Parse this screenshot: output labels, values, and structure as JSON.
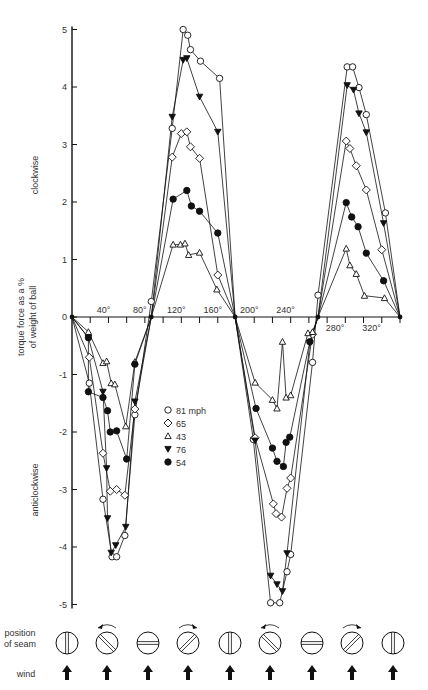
{
  "header": {
    "title": "THE BOWLER'S ART"
  },
  "chart_data": {
    "type": "line",
    "title": "",
    "xlabel": "",
    "ylabel": "torque force as a % of weight of ball",
    "ylabel_lines": [
      "torque force as a %",
      "of weight of ball"
    ],
    "y_region_labels": {
      "positive": "clockwise",
      "negative": "anticlockwise"
    },
    "xlim": [
      0,
      360
    ],
    "ylim": [
      -5,
      5
    ],
    "grid": false,
    "x_ticks": [
      0,
      20,
      40,
      60,
      80,
      100,
      120,
      140,
      160,
      180,
      200,
      220,
      240,
      260,
      280,
      300,
      320,
      340,
      360
    ],
    "x_tick_labels": [
      {
        "value": 40,
        "label": "40°",
        "side": "above"
      },
      {
        "value": 80,
        "label": "80°",
        "side": "above"
      },
      {
        "value": 120,
        "label": "120°",
        "side": "above"
      },
      {
        "value": 160,
        "label": "160°",
        "side": "above"
      },
      {
        "value": 200,
        "label": "200°",
        "side": "above"
      },
      {
        "value": 240,
        "label": "240°",
        "side": "above"
      },
      {
        "value": 280,
        "label": "280°",
        "side": "below"
      },
      {
        "value": 320,
        "label": "320°",
        "side": "below"
      }
    ],
    "y_ticks": [
      5,
      4,
      3,
      2,
      1,
      0,
      -1,
      -2,
      -3,
      -4,
      -5
    ],
    "y_tick_labels": [
      "5",
      "4",
      "3",
      "2",
      "1",
      "0",
      "-1",
      "-2",
      "-3",
      "-4",
      "-5"
    ],
    "legend_placement": "center",
    "series": [
      {
        "name": "81 mph",
        "marker": "open-circle",
        "points": [
          [
            0,
            0
          ],
          [
            19,
            -1.15
          ],
          [
            34,
            -3.17
          ],
          [
            44,
            -4.17
          ],
          [
            49,
            -4.17
          ],
          [
            58,
            -3.8
          ],
          [
            69,
            -1.7
          ],
          [
            87,
            0.27
          ],
          [
            110,
            3.28
          ],
          [
            122,
            5.0
          ],
          [
            127,
            4.9
          ],
          [
            130,
            4.65
          ],
          [
            141,
            4.45
          ],
          [
            162,
            4.15
          ],
          [
            179,
            0
          ],
          [
            199,
            -2.13
          ],
          [
            218,
            -4.97
          ],
          [
            228,
            -4.97
          ],
          [
            236,
            -4.43
          ],
          [
            240,
            -4.13
          ],
          [
            264,
            -0.79
          ],
          [
            270,
            0.38
          ],
          [
            302,
            4.35
          ],
          [
            308,
            4.35
          ],
          [
            315,
            3.99
          ],
          [
            323,
            3.52
          ],
          [
            344,
            1.81
          ],
          [
            360,
            0
          ]
        ]
      },
      {
        "name": "65",
        "marker": "open-diamond",
        "points": [
          [
            0,
            0
          ],
          [
            19,
            -0.7
          ],
          [
            34,
            -2.37
          ],
          [
            42,
            -3.03
          ],
          [
            49,
            -3.0
          ],
          [
            58,
            -3.1
          ],
          [
            69,
            -1.6
          ],
          [
            87,
            0
          ],
          [
            110,
            2.78
          ],
          [
            120,
            3.19
          ],
          [
            126,
            3.22
          ],
          [
            130,
            2.96
          ],
          [
            140,
            2.76
          ],
          [
            160,
            0.73
          ],
          [
            179,
            0
          ],
          [
            201,
            -2.1
          ],
          [
            221,
            -3.25
          ],
          [
            224,
            -3.42
          ],
          [
            230,
            -3.48
          ],
          [
            236,
            -2.98
          ],
          [
            240,
            -2.8
          ],
          [
            264,
            -0.3
          ],
          [
            270,
            0
          ],
          [
            301,
            3.06
          ],
          [
            305,
            2.93
          ],
          [
            312,
            2.63
          ],
          [
            323,
            2.21
          ],
          [
            340,
            1.17
          ],
          [
            360,
            0
          ]
        ]
      },
      {
        "name": "43",
        "marker": "open-triangle",
        "points": [
          [
            0,
            0
          ],
          [
            18,
            -0.26
          ],
          [
            34,
            -0.8
          ],
          [
            38,
            -0.77
          ],
          [
            43,
            -1.15
          ],
          [
            47,
            -1.17
          ],
          [
            59,
            -1.9
          ],
          [
            69,
            -0.78
          ],
          [
            87,
            0
          ],
          [
            111,
            1.26
          ],
          [
            119,
            1.26
          ],
          [
            124,
            1.28
          ],
          [
            128,
            1.08
          ],
          [
            140,
            1.12
          ],
          [
            159,
            0.48
          ],
          [
            179,
            0
          ],
          [
            201,
            -1.14
          ],
          [
            220,
            -1.44
          ],
          [
            225,
            -1.59
          ],
          [
            231,
            -0.43
          ],
          [
            235,
            -1.4
          ],
          [
            240,
            -1.36
          ],
          [
            259,
            -0.28
          ],
          [
            264,
            -0.26
          ],
          [
            270,
            0
          ],
          [
            301,
            1.19
          ],
          [
            305,
            0.9
          ],
          [
            312,
            0.75
          ],
          [
            321,
            0.37
          ],
          [
            343,
            0.33
          ],
          [
            360,
            0
          ]
        ]
      },
      {
        "name": "76",
        "marker": "filled-triangle-down",
        "points": [
          [
            0,
            0
          ],
          [
            18,
            -0.36
          ],
          [
            34,
            -1.3
          ],
          [
            38,
            -2.63
          ],
          [
            39,
            -3.5
          ],
          [
            43,
            -4.1
          ],
          [
            48,
            -3.97
          ],
          [
            59,
            -3.65
          ],
          [
            69,
            -1.47
          ],
          [
            87,
            0
          ],
          [
            110,
            3.48
          ],
          [
            122,
            4.47
          ],
          [
            126,
            4.5
          ],
          [
            140,
            3.83
          ],
          [
            160,
            3.22
          ],
          [
            179,
            0
          ],
          [
            201,
            -2.15
          ],
          [
            218,
            -4.5
          ],
          [
            225,
            -4.65
          ],
          [
            231,
            -4.77
          ],
          [
            236,
            -4.11
          ],
          [
            261,
            -0.45
          ],
          [
            270,
            0
          ],
          [
            302,
            4.03
          ],
          [
            309,
            3.95
          ],
          [
            315,
            3.54
          ],
          [
            323,
            3.21
          ],
          [
            342,
            1.63
          ],
          [
            360,
            0
          ]
        ]
      },
      {
        "name": "54",
        "marker": "filled-circle",
        "points": [
          [
            0,
            0
          ],
          [
            18,
            -0.36
          ],
          [
            18,
            -1.3
          ],
          [
            34,
            -1.4
          ],
          [
            39,
            -1.63
          ],
          [
            42,
            -2.0
          ],
          [
            49,
            -1.98
          ],
          [
            60,
            -2.47
          ],
          [
            69,
            -0.82
          ],
          [
            87,
            0
          ],
          [
            111,
            2.05
          ],
          [
            126,
            2.2
          ],
          [
            131,
            1.93
          ],
          [
            140,
            1.84
          ],
          [
            160,
            1.46
          ],
          [
            179,
            0
          ],
          [
            202,
            -1.59
          ],
          [
            220,
            -2.28
          ],
          [
            225,
            -2.51
          ],
          [
            232,
            -2.6
          ],
          [
            235,
            -2.18
          ],
          [
            239,
            -2.09
          ],
          [
            261,
            -0.43
          ],
          [
            270,
            0
          ],
          [
            301,
            1.99
          ],
          [
            307,
            1.74
          ],
          [
            314,
            1.57
          ],
          [
            323,
            1.11
          ],
          [
            342,
            0.63
          ],
          [
            360,
            0
          ]
        ]
      }
    ]
  },
  "strip": {
    "row_labels": {
      "position_line1": "position",
      "position_line2": "of seam",
      "wind": "wind"
    },
    "balls": [
      {
        "seam": "vertical",
        "rotation": "none"
      },
      {
        "seam": "backslash",
        "rotation": "anticlockwise"
      },
      {
        "seam": "horizontal",
        "rotation": "none"
      },
      {
        "seam": "slash",
        "rotation": "clockwise"
      },
      {
        "seam": "vertical",
        "rotation": "none"
      },
      {
        "seam": "backslash",
        "rotation": "anticlockwise"
      },
      {
        "seam": "horizontal",
        "rotation": "none"
      },
      {
        "seam": "slash",
        "rotation": "clockwise"
      },
      {
        "seam": "vertical",
        "rotation": "none"
      }
    ],
    "wind_icon": "up-arrow-icon"
  }
}
